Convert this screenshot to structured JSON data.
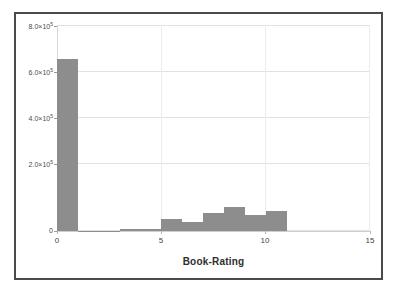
{
  "chart_data": {
    "type": "bar",
    "title": "",
    "subtitle": "",
    "xlabel": "Book-Rating",
    "ylabel": "",
    "xlim": [
      0,
      15
    ],
    "ylim": [
      0,
      860000
    ],
    "grid": true,
    "legend": null,
    "bin_width": 1,
    "categories": [
      "0",
      "1",
      "2",
      "3",
      "4",
      "5",
      "6",
      "7",
      "8",
      "9",
      "10"
    ],
    "bin_starts": [
      0,
      1,
      2,
      3,
      4,
      5,
      6,
      7,
      8,
      9,
      10
    ],
    "values": [
      720000,
      1500,
      1200,
      9000,
      10000,
      50000,
      36000,
      75000,
      101000,
      68000,
      82000
    ],
    "x_ticks": [
      {
        "value": 0,
        "label": "0"
      },
      {
        "value": 5,
        "label": "5"
      },
      {
        "value": 10,
        "label": "10"
      },
      {
        "value": 15,
        "label": "15"
      }
    ],
    "y_ticks": [
      {
        "value": 0,
        "mantissa": "0",
        "exponent": "",
        "label": "0"
      },
      {
        "value": 200000,
        "mantissa": "2.0×10",
        "exponent": "5",
        "label": "2.0×10⁵"
      },
      {
        "value": 400000,
        "mantissa": "4.0×10",
        "exponent": "5",
        "label": "4.0×10⁵"
      },
      {
        "value": 600000,
        "mantissa": "6.0×10",
        "exponent": "5",
        "label": "6.0×10⁵"
      },
      {
        "value": 800000,
        "mantissa": "8.0×10",
        "exponent": "5",
        "label": "8.0×10⁵"
      }
    ],
    "colors": {
      "bar": "#8d8d8d",
      "gridline": "#e2e2e2",
      "axis": "#cfcfcf",
      "frame": "#4a4a4a",
      "text": "#3f3f3f",
      "background": "#ffffff"
    }
  },
  "figure": {
    "frame_visible": true
  }
}
